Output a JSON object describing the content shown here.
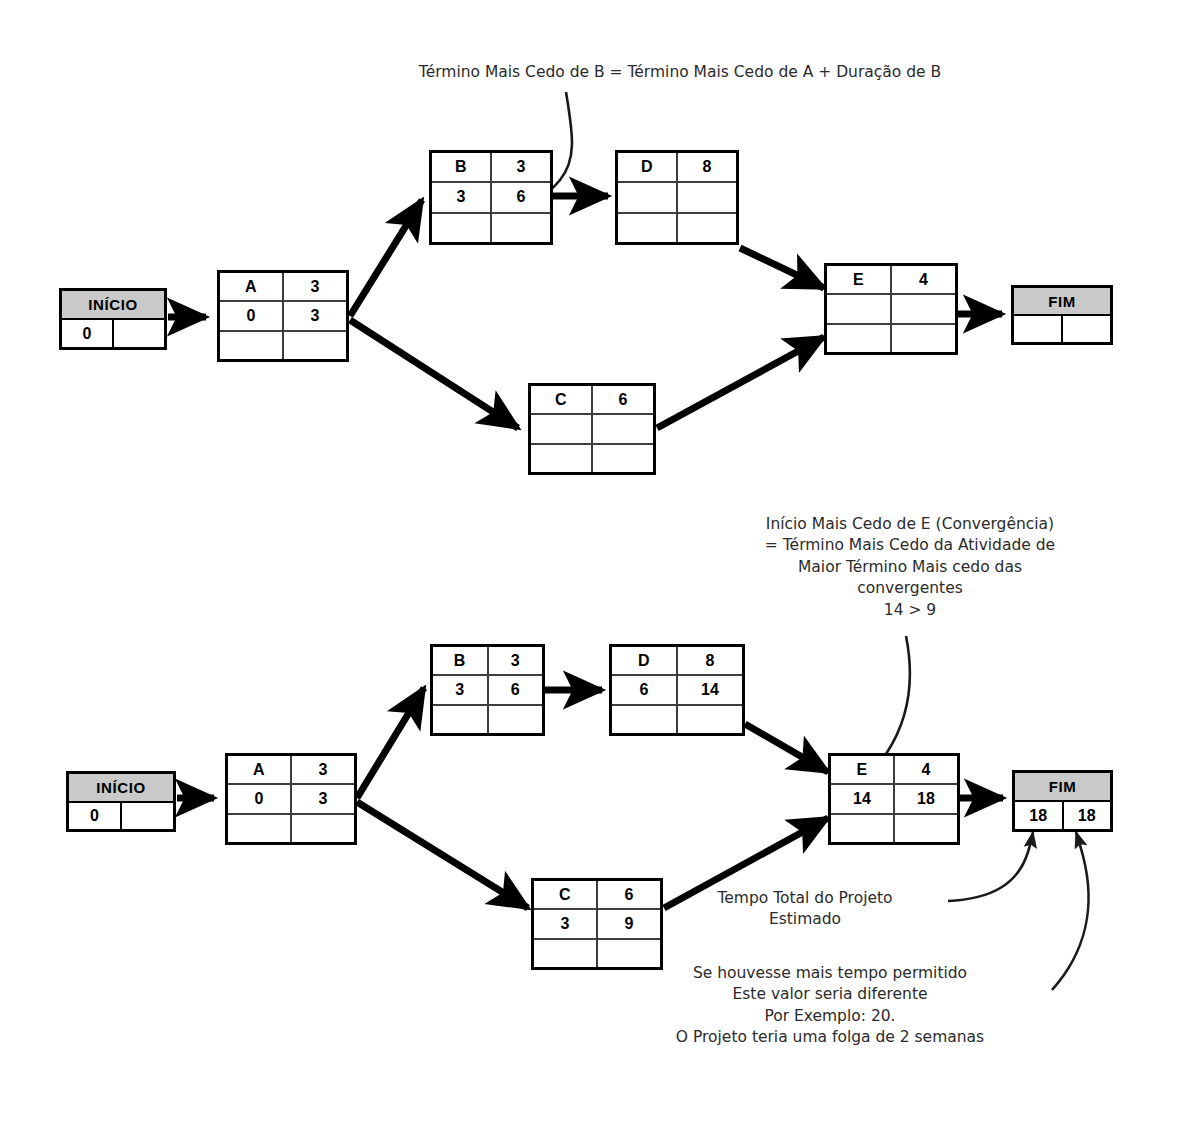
{
  "page": {
    "language": "pt-BR",
    "width": 1183,
    "height": 1141,
    "background_color": "#ffffff",
    "line_color": "#000000",
    "terminal_fill_color": "#c9c9c9"
  },
  "diagram_top": {
    "name": "Rede parcial — cálculo do Término Mais Cedo de B",
    "annotation": {
      "text": "Término Mais Cedo de B = Término Mais Cedo de A + Duração de B",
      "points_to": "node-b-early-finish"
    },
    "start_node": {
      "label": "INÍCIO",
      "left_value": "0",
      "right_value": ""
    },
    "end_node": {
      "label": "FIM",
      "left_value": "",
      "right_value": ""
    },
    "nodes": [
      {
        "id": "A",
        "activity": "A",
        "duration": "3",
        "early_start": "0",
        "early_finish": "3",
        "late_start": "",
        "late_finish": ""
      },
      {
        "id": "B",
        "activity": "B",
        "duration": "3",
        "early_start": "3",
        "early_finish": "6",
        "late_start": "",
        "late_finish": ""
      },
      {
        "id": "D",
        "activity": "D",
        "duration": "8",
        "early_start": "",
        "early_finish": "",
        "late_start": "",
        "late_finish": ""
      },
      {
        "id": "C",
        "activity": "C",
        "duration": "6",
        "early_start": "",
        "early_finish": "",
        "late_start": "",
        "late_finish": ""
      },
      {
        "id": "E",
        "activity": "E",
        "duration": "4",
        "early_start": "",
        "early_finish": "",
        "late_start": "",
        "late_finish": ""
      }
    ],
    "edges": [
      "INÍCIO→A",
      "A→B",
      "A→C",
      "B→D",
      "D→E",
      "C→E",
      "E→FIM"
    ]
  },
  "diagram_bottom": {
    "name": "Rede completa — datas mais cedo calculadas",
    "annotation_convergence": {
      "text": "Início Mais Cedo de E (Convergência)\n= Término Mais Cedo da Atividade de\nMaior Término Mais cedo das\nconvergentes\n14 > 9",
      "comparison": "14 > 9",
      "points_to": "node-e-early-start"
    },
    "annotation_total_time": {
      "text": "Tempo Total do Projeto\nEstimado",
      "points_to": "fim-left-value"
    },
    "annotation_slack": {
      "text": "Se houvesse mais tempo permitido\nEste valor seria diferente\nPor Exemplo: 20.\nO Projeto teria uma folga de 2 semanas",
      "points_to": "fim-right-value"
    },
    "start_node": {
      "label": "INÍCIO",
      "left_value": "0",
      "right_value": ""
    },
    "end_node": {
      "label": "FIM",
      "left_value": "18",
      "right_value": "18"
    },
    "nodes": [
      {
        "id": "A",
        "activity": "A",
        "duration": "3",
        "early_start": "0",
        "early_finish": "3",
        "late_start": "",
        "late_finish": ""
      },
      {
        "id": "B",
        "activity": "B",
        "duration": "3",
        "early_start": "3",
        "early_finish": "6",
        "late_start": "",
        "late_finish": ""
      },
      {
        "id": "D",
        "activity": "D",
        "duration": "8",
        "early_start": "6",
        "early_finish": "14",
        "late_start": "",
        "late_finish": ""
      },
      {
        "id": "C",
        "activity": "C",
        "duration": "6",
        "early_start": "3",
        "early_finish": "9",
        "late_start": "",
        "late_finish": ""
      },
      {
        "id": "E",
        "activity": "E",
        "duration": "4",
        "early_start": "14",
        "early_finish": "18",
        "late_start": "",
        "late_finish": ""
      }
    ],
    "edges": [
      "INÍCIO→A",
      "A→B",
      "A→C",
      "B→D",
      "D→E",
      "C→E",
      "E→FIM"
    ]
  }
}
